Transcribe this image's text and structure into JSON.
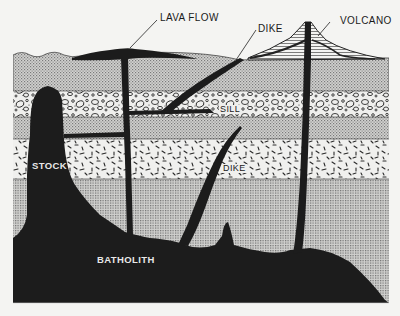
{
  "diagram": {
    "type": "geologic cross-section",
    "labels": {
      "lava_flow": "LAVA FLOW",
      "dike_upper": "DIKE",
      "volcano": "VOLCANO",
      "sill": "SILL",
      "stock": "STOCK",
      "dike_lower": "DIKE",
      "batholith": "BATHOLITH"
    },
    "layers": [
      {
        "name": "upper-sedimentary",
        "pattern": "fine-stipple"
      },
      {
        "name": "conglomerate",
        "pattern": "pebbles"
      },
      {
        "name": "middle-sedimentary",
        "pattern": "fine-stipple"
      },
      {
        "name": "tuff",
        "pattern": "dashes"
      },
      {
        "name": "lower-sedimentary",
        "pattern": "fine-grid"
      }
    ],
    "colors": {
      "intrusion": "#1c1c1c",
      "stipple": "#bdbdbd",
      "paper": "#f4f4f2",
      "line": "#222222"
    }
  }
}
